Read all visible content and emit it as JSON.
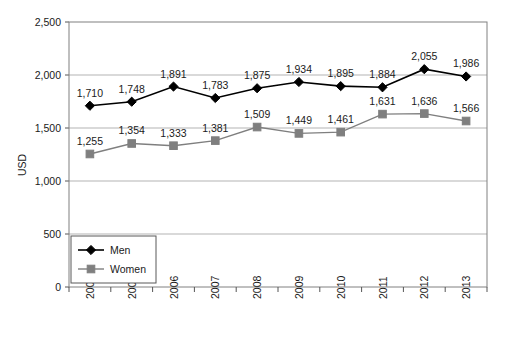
{
  "chart_data": {
    "type": "line",
    "title": "",
    "subtitle": "",
    "xlabel": "",
    "ylabel": "USD",
    "categories": [
      "2004",
      "2005",
      "2006",
      "2007",
      "2008",
      "2009",
      "2010",
      "2011",
      "2012",
      "2013"
    ],
    "series": [
      {
        "name": "Men",
        "color": "#000000",
        "marker": "diamond",
        "values": [
          1710,
          1748,
          1891,
          1783,
          1875,
          1934,
          1895,
          1884,
          2055,
          1986
        ],
        "labels": [
          "1,710",
          "1,748",
          "1,891",
          "1,783",
          "1,875",
          "1,934",
          "1,895",
          "1,884",
          "2,055",
          "1,986"
        ]
      },
      {
        "name": "Women",
        "color": "#7f7f7f",
        "marker": "square",
        "values": [
          1255,
          1354,
          1333,
          1381,
          1509,
          1449,
          1461,
          1631,
          1636,
          1566
        ],
        "labels": [
          "1,255",
          "1,354",
          "1,333",
          "1,381",
          "1,509",
          "1,449",
          "1,461",
          "1,631",
          "1,636",
          "1,566"
        ]
      }
    ],
    "ylim": [
      0,
      2500
    ],
    "ytick_step": 500,
    "ytick_labels": [
      "2,500",
      "2,000",
      "1,500",
      "1,000",
      "500",
      "0"
    ],
    "ytick_values": [
      2500,
      2000,
      1500,
      1000,
      500,
      0
    ],
    "grid": true,
    "grid_color": "#b3b3b3",
    "legend_position": "bottom-left",
    "plot_border_color": "#808080",
    "background": "#ffffff"
  },
  "legend": {
    "items": [
      {
        "label": "Men"
      },
      {
        "label": "Women"
      }
    ]
  }
}
